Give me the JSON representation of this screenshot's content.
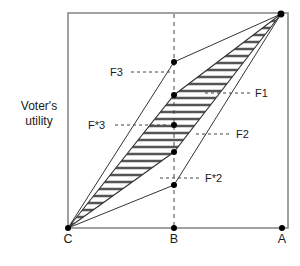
{
  "figure": {
    "y_axis_label": "Voter's\nutility",
    "frame": {
      "left": 68,
      "top": 13,
      "right": 288,
      "bottom": 228,
      "color": "#808080"
    },
    "colors": {
      "line": "#333333",
      "frame": "#8a8a8a",
      "dash": "#444444",
      "point": "#000000",
      "hatch": "#555555",
      "text": "#1a1a1a",
      "background": "#ffffff"
    },
    "axis_points": [
      {
        "name": "C",
        "label": "C",
        "x": 68,
        "y": 228
      },
      {
        "name": "B",
        "label": "B",
        "x": 174,
        "y": 228
      },
      {
        "name": "A",
        "label": "A",
        "x": 282,
        "y": 228
      }
    ],
    "apex": {
      "name": "apex",
      "x": 281,
      "y": 14
    },
    "envelope": {
      "upper_vertex": {
        "x": 174,
        "y": 62
      },
      "lower_vertex": {
        "x": 174,
        "y": 185
      },
      "description": "Outer envelope from C through upper and lower kink vertices to the apex at A-top"
    },
    "hatched_region": {
      "description": "Horizontally hatched lens between the two inner chords from C to the apex",
      "upper_chord_mid": {
        "x": 174,
        "y": 95
      },
      "lower_chord_mid": {
        "x": 174,
        "y": 152
      },
      "hatch_line_count": 26,
      "hatch_spacing_px": 7
    },
    "marked_points": [
      {
        "name": "F3",
        "x": 174,
        "y": 62
      },
      {
        "name": "F1",
        "x": 174,
        "y": 95
      },
      {
        "name": "F*3",
        "x": 174,
        "y": 125
      },
      {
        "name": "F2",
        "x": 174,
        "y": 152
      },
      {
        "name": "F*2",
        "x": 174,
        "y": 185
      }
    ],
    "callouts": [
      {
        "name": "F3",
        "label": "F3",
        "text_x": 110,
        "text_y": 66,
        "side": "left",
        "leader_from_x": 131,
        "leader_from_y": 72,
        "leader_to_x": 170,
        "leader_to_y": 72
      },
      {
        "name": "F1",
        "label": "F1",
        "text_x": 255,
        "text_y": 87,
        "side": "right",
        "leader_from_x": 205,
        "leader_from_y": 93,
        "leader_to_x": 251,
        "leader_to_y": 93
      },
      {
        "name": "F*3",
        "label": "F*3",
        "text_x": 88,
        "text_y": 119,
        "side": "left",
        "leader_from_x": 115,
        "leader_from_y": 125,
        "leader_to_x": 168,
        "leader_to_y": 125
      },
      {
        "name": "F2",
        "label": "F2",
        "text_x": 236,
        "text_y": 128,
        "side": "right",
        "leader_from_x": 196,
        "leader_from_y": 134,
        "leader_to_x": 232,
        "leader_to_y": 134
      },
      {
        "name": "F*2",
        "label": "F*2",
        "text_x": 205,
        "text_y": 172,
        "side": "right",
        "leader_from_x": 160,
        "leader_from_y": 178,
        "leader_to_x": 201,
        "leader_to_y": 178
      }
    ],
    "vertical_guide": {
      "name": "B-vertical-dashed",
      "x": 174,
      "y_top": 14,
      "y_bottom": 228
    }
  }
}
